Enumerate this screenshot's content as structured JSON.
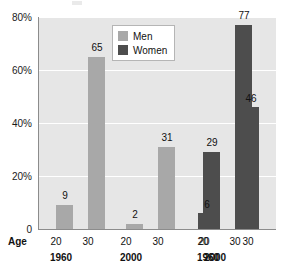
{
  "chart_data": {
    "type": "bar",
    "title": "",
    "xlabel": "Age",
    "ylabel": "",
    "ylim": [
      0,
      80
    ],
    "grid": true,
    "legend_position": "top-center",
    "y_ticks": [
      "0",
      "20%",
      "40%",
      "60%",
      "80%"
    ],
    "y_tick_values": [
      0,
      20,
      40,
      60,
      80
    ],
    "legend": [
      {
        "name": "Men",
        "color": "#a8a8a8"
      },
      {
        "name": "Women",
        "color": "#4d4d4d"
      }
    ],
    "series": [
      {
        "name": "Men",
        "color": "#a8a8a8",
        "points": [
          {
            "year": "1960",
            "age": "20",
            "value": 9
          },
          {
            "year": "1960",
            "age": "30",
            "value": 65
          },
          {
            "year": "2000",
            "age": "20",
            "value": 2
          },
          {
            "year": "2000",
            "age": "30",
            "value": 31
          }
        ]
      },
      {
        "name": "Women",
        "color": "#4d4d4d",
        "points": [
          {
            "year": "1960",
            "age": "20",
            "value": 29
          },
          {
            "year": "1960",
            "age": "30",
            "value": 77
          },
          {
            "year": "2000",
            "age": "20",
            "value": 6
          },
          {
            "year": "2000",
            "age": "30",
            "value": 46
          }
        ]
      }
    ],
    "groups": [
      {
        "year": "1960",
        "series": "Men",
        "ages": [
          "20",
          "30"
        ],
        "values": [
          9,
          65
        ]
      },
      {
        "year": "2000",
        "series": "Men",
        "ages": [
          "20",
          "30"
        ],
        "values": [
          2,
          31
        ]
      },
      {
        "year": "1960",
        "series": "Women",
        "ages": [
          "20",
          "30"
        ],
        "values": [
          29,
          77
        ]
      },
      {
        "year": "2000",
        "series": "Women",
        "ages": [
          "20",
          "30"
        ],
        "values": [
          6,
          46
        ]
      }
    ]
  },
  "axis": {
    "age_label": "Age",
    "y0": "0",
    "y20": "20%",
    "y40": "40%",
    "y60": "60%",
    "y80": "80%",
    "ages": {
      "a1": "20",
      "a2": "30",
      "a3": "20",
      "a4": "30",
      "a5": "20",
      "a6": "30",
      "a7": "20",
      "a8": "30"
    },
    "years": {
      "y1": "1960",
      "y2": "2000",
      "y3": "1960",
      "y4": "2000"
    }
  },
  "legend": {
    "men": "Men",
    "women": "Women"
  },
  "bar_labels": {
    "b1": "9",
    "b2": "65",
    "b3": "2",
    "b4": "31",
    "b5": "29",
    "b6": "77",
    "b7": "6",
    "b8": "46"
  },
  "colors": {
    "men": "#a8a8a8",
    "women": "#4d4d4d",
    "plot_background": "#e6e6e6",
    "gridline": "#ffffff",
    "axis": "#8c8c8c"
  }
}
